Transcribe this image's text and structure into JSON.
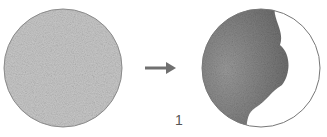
{
  "diagram": {
    "before": {
      "name": "uniform-textured-circle",
      "fill_color": "#c8c8c8",
      "edge_color": "#888888"
    },
    "arrow": {
      "color": "#707070",
      "direction": "right"
    },
    "after": {
      "name": "partially-shaded-circle",
      "shaded_color": "#8a8a8a",
      "clear_color": "#ffffff",
      "edge_color": "#777777"
    },
    "label": "1"
  }
}
